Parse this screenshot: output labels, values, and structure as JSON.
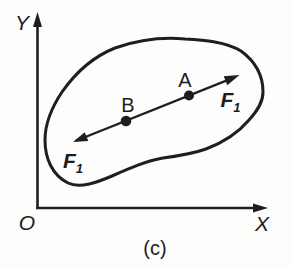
{
  "figure": {
    "caption": "(c)",
    "axes": {
      "y_label": "Y",
      "x_label": "X",
      "origin_label": "O"
    },
    "points": {
      "a_label": "A",
      "b_label": "B"
    },
    "forces": {
      "upper": {
        "symbol": "F",
        "subscript": "1",
        "applied_at": "A",
        "direction": "up-right"
      },
      "lower": {
        "symbol": "F",
        "subscript": "1",
        "applied_at": "B",
        "direction": "down-left"
      }
    },
    "colors": {
      "ink": "#1e1e1e",
      "paper": "#fdfdfb"
    }
  }
}
